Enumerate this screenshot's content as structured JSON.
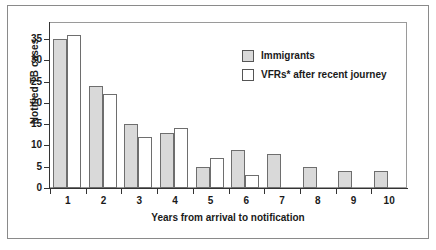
{
  "chart_data": {
    "type": "bar",
    "title": "",
    "xlabel": "Years from arrival to notification",
    "ylabel": "Notified TB cases",
    "categories": [
      "1",
      "2",
      "3",
      "4",
      "5",
      "6",
      "7",
      "8",
      "9",
      "10"
    ],
    "series": [
      {
        "name": "Immigrants",
        "color": "#d9d9d9",
        "values": [
          35,
          24,
          15,
          13,
          5,
          9,
          8,
          5,
          4,
          4
        ]
      },
      {
        "name": "VFRs* after recent journey",
        "color": "#ffffff",
        "values": [
          36,
          22,
          12,
          14,
          7,
          3,
          0,
          0,
          0,
          0
        ]
      }
    ],
    "ylim": [
      0,
      39
    ],
    "yticks": [
      0,
      5,
      10,
      15,
      20,
      25,
      30,
      35
    ],
    "ytick_labels": [
      "0",
      "5",
      "10",
      "15",
      "20",
      "25",
      "30",
      "35"
    ],
    "grid": false,
    "legend_position": "upper-right"
  },
  "legend": {
    "entries": [
      {
        "label": "Immigrants",
        "swatch": "gray-filled-square"
      },
      {
        "label": "VFRs* after recent journey",
        "swatch": "white-square"
      }
    ]
  }
}
